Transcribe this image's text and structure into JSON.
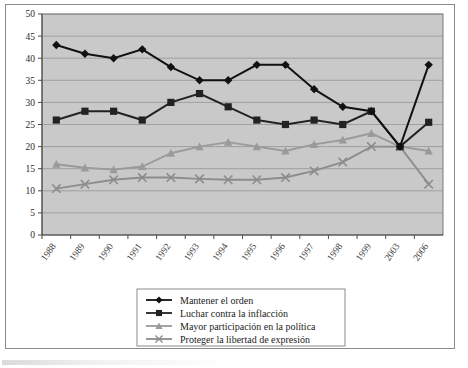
{
  "chart_data": {
    "type": "line",
    "title": "",
    "xlabel": "",
    "ylabel": "",
    "ylim": [
      0,
      50
    ],
    "ytick_step": 5,
    "grid": true,
    "legend_position": "bottom",
    "plot_background": "#c9c9c9",
    "categories": [
      "1988",
      "1989",
      "1990",
      "1991",
      "1992",
      "1993",
      "1994",
      "1995",
      "1996",
      "1997",
      "1998",
      "1999",
      "2003",
      "2006"
    ],
    "yticks": [
      "0",
      "5",
      "10",
      "15",
      "20",
      "25",
      "30",
      "35",
      "40",
      "45",
      "50"
    ],
    "series": [
      {
        "name": "Mantener el orden",
        "marker": "diamond",
        "color": "#111111",
        "values": [
          43,
          41,
          40,
          42,
          38,
          35,
          35,
          38.5,
          38.5,
          33,
          29,
          28,
          20,
          38.5
        ]
      },
      {
        "name": "Luchar contra la inflacción",
        "marker": "square",
        "color": "#222222",
        "values": [
          26,
          28,
          28,
          26,
          30,
          32,
          29,
          26,
          25,
          26,
          25,
          28,
          20,
          25.5
        ]
      },
      {
        "name": "Mayor participación en la política",
        "marker": "triangle",
        "color": "#9a9a9a",
        "values": [
          16,
          15.2,
          14.8,
          15.5,
          18.5,
          20,
          21,
          20,
          19,
          20.5,
          21.5,
          23,
          20,
          19
        ]
      },
      {
        "name": "Proteger la libertad de expresión",
        "marker": "cross",
        "color": "#8c8c8c",
        "values": [
          10.5,
          11.5,
          12.5,
          13,
          13,
          12.7,
          12.5,
          12.5,
          13,
          14.5,
          16.5,
          20,
          20,
          11.5
        ]
      }
    ]
  },
  "legend": {
    "items": [
      {
        "label": "Mantener el orden",
        "marker": "diamond",
        "color": "#111111"
      },
      {
        "label": "Luchar contra la inflacción",
        "marker": "square",
        "color": "#222222"
      },
      {
        "label": "Mayor participación en la política",
        "marker": "triangle",
        "color": "#9a9a9a"
      },
      {
        "label": "Proteger la libertad de expresión",
        "marker": "cross",
        "color": "#8c8c8c"
      }
    ]
  }
}
